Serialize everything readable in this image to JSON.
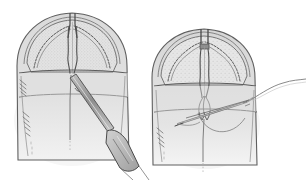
{
  "figure": {
    "title": "Cleft palate two-stage repair illustration",
    "background_color": "#ffffff",
    "width": 306,
    "height": 180,
    "style": "pencil line drawing with gray wash shading",
    "panel_count": 2
  },
  "palette": {
    "background": "#ffffff",
    "ink_dark": "#4a4a4a",
    "ink_mid": "#6e6e6e",
    "ink_light": "#9a9a9a",
    "wash_outer": "#d9d9d9",
    "wash_inner": "#cfcfcf",
    "wash_pale": "#e6e6e6",
    "stipple": "#bdbdbd",
    "instrument_fill": "#c4c4c4",
    "instrument_edge": "#5a5a5a",
    "shadow": "#efefef"
  },
  "panels": [
    {
      "id": "panel-left",
      "name": "dissection-panel",
      "label": "Left panel: midline incision with elevator",
      "subject": "palate-with-midline-cleft",
      "elements": [
        {
          "name": "palate-outline",
          "label": "Palatal arch outline"
        },
        {
          "name": "midline-cleft",
          "label": "Midline cleft / incision line"
        },
        {
          "name": "mucosal-flap-edge",
          "label": "Scalloped mucosal flap edge"
        },
        {
          "name": "stippled-field",
          "label": "Stippled exposed surface"
        },
        {
          "name": "transverse-band",
          "label": "Transverse anatomical band"
        },
        {
          "name": "hatching-left",
          "label": "Hatch shading on left border"
        },
        {
          "name": "elevator-instrument",
          "label": "Periosteal elevator instrument"
        }
      ]
    },
    {
      "id": "panel-right",
      "name": "suture-panel",
      "label": "Right panel: closure with needle and suture",
      "subject": "palate-with-approximated-edges",
      "elements": [
        {
          "name": "palate-outline",
          "label": "Palatal arch outline"
        },
        {
          "name": "approximated-midline",
          "label": "Approximated midline edges"
        },
        {
          "name": "mucosal-flap-edge",
          "label": "Scalloped mucosal flap edge"
        },
        {
          "name": "stippled-field",
          "label": "Stippled exposed surface"
        },
        {
          "name": "transverse-band",
          "label": "Transverse anatomical band"
        },
        {
          "name": "hatching-left",
          "label": "Hatch shading on left border"
        },
        {
          "name": "suture-needle",
          "label": "Curved suture needle"
        },
        {
          "name": "suture-thread",
          "label": "Suture thread trailing right"
        },
        {
          "name": "needle-arc",
          "label": "Needle path arc through tissue"
        }
      ]
    }
  ]
}
